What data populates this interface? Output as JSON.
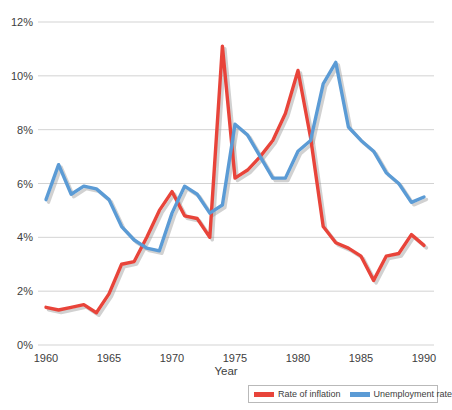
{
  "chart_data": {
    "type": "line",
    "title": "",
    "xlabel": "Year",
    "ylabel": "",
    "grid": true,
    "legend_position": "bottom-right",
    "xlim": [
      1960,
      1990
    ],
    "ylim": [
      0,
      12
    ],
    "y_tick_labels": [
      "0%",
      "2%",
      "4%",
      "6%",
      "8%",
      "10%",
      "12%"
    ],
    "y_ticks": [
      0,
      2,
      4,
      6,
      8,
      10,
      12
    ],
    "x_tick_labels": [
      "1960",
      "1965",
      "1970",
      "1975",
      "1980",
      "1985",
      "1990"
    ],
    "x_ticks": [
      1960,
      1965,
      1970,
      1975,
      1980,
      1985,
      1990
    ],
    "x": [
      1960,
      1961,
      1962,
      1963,
      1964,
      1965,
      1966,
      1967,
      1968,
      1969,
      1970,
      1971,
      1972,
      1973,
      1974,
      1975,
      1976,
      1977,
      1978,
      1979,
      1980,
      1981,
      1982,
      1983,
      1984,
      1985,
      1986,
      1987,
      1988,
      1989,
      1990
    ],
    "series": [
      {
        "name": "Rate of inflation",
        "color": "#E8443A",
        "values": [
          1.4,
          1.3,
          1.4,
          1.5,
          1.2,
          1.9,
          3.0,
          3.1,
          4.0,
          5.0,
          5.7,
          4.8,
          4.7,
          4.0,
          11.1,
          6.2,
          6.5,
          7.0,
          7.6,
          8.6,
          10.2,
          7.7,
          4.4,
          3.8,
          3.6,
          3.3,
          2.4,
          3.3,
          3.4,
          4.1,
          3.7
        ],
        "unit": "%"
      },
      {
        "name": "Unemployment rate",
        "color": "#5B9BD5",
        "values": [
          5.4,
          6.7,
          5.6,
          5.9,
          5.8,
          5.4,
          4.4,
          3.9,
          3.6,
          3.5,
          4.9,
          5.9,
          5.6,
          4.9,
          5.2,
          8.2,
          7.8,
          7.0,
          6.2,
          6.2,
          7.2,
          7.6,
          9.7,
          10.5,
          8.1,
          7.6,
          7.2,
          6.4,
          6.0,
          5.3,
          5.5
        ],
        "unit": "%"
      }
    ]
  },
  "legend": {
    "items": [
      {
        "label": "Rate of inflation",
        "color": "#E8443A"
      },
      {
        "label": "Unemployment rate",
        "color": "#5B9BD5"
      }
    ]
  },
  "axes": {
    "x_title": "Year"
  }
}
